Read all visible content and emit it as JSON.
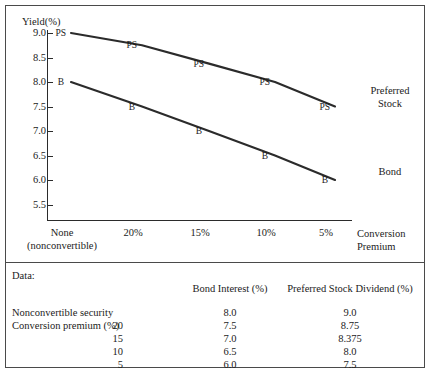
{
  "chart_data": {
    "type": "line",
    "title": "",
    "xlabel": "Conversion Premium",
    "ylabel": "Yield(%)",
    "ylim": [
      5.5,
      9.0
    ],
    "grid": false,
    "legend_position": "right-inline",
    "categories": [
      "None\n(nonconvertible)",
      "20%",
      "15%",
      "10%",
      "5%"
    ],
    "x_tick_labels": [
      "None",
      "20%",
      "15%",
      "10%",
      "5%"
    ],
    "x_tick_sublabels": [
      "(nonconvertible)",
      "",
      "",
      "",
      ""
    ],
    "y_tick_labels": [
      "9.0",
      "8.5",
      "8.0",
      "7.5",
      "7.0",
      "6.5",
      "6.0",
      "5.5"
    ],
    "y_tick_values": [
      9.0,
      8.5,
      8.0,
      7.5,
      7.0,
      6.5,
      6.0,
      5.5
    ],
    "series": [
      {
        "name": "Preferred Stock",
        "point_label": "PS",
        "values": [
          9.0,
          8.75,
          8.375,
          8.0,
          7.5
        ]
      },
      {
        "name": "Bond",
        "point_label": "B",
        "values": [
          8.0,
          7.5,
          7.0,
          6.5,
          6.0
        ]
      }
    ],
    "annotations": [
      {
        "text_line1": "Preferred",
        "text_line2": "Stock"
      },
      {
        "text_line1": "Bond",
        "text_line2": ""
      }
    ]
  },
  "chart": {
    "y_axis_title": "Yield(%)",
    "x_axis_title_line1": "Conversion",
    "x_axis_title_line2": "Premium",
    "y_ticks": [
      "9.0",
      "8.5",
      "8.0",
      "7.5",
      "7.0",
      "6.5",
      "6.0",
      "5.5"
    ],
    "x_ticks": [
      "None",
      "20%",
      "15%",
      "10%",
      "5%"
    ],
    "x_tick_sub": "(nonconvertible)",
    "ps_labels": [
      "PS",
      "PS",
      "PS",
      "PS",
      "PS"
    ],
    "b_labels": [
      "B",
      "B",
      "B",
      "B",
      "B"
    ],
    "legend_ps_line1": "Preferred",
    "legend_ps_line2": "Stock",
    "legend_bond": "Bond"
  },
  "table": {
    "caption": "Data:",
    "headers": [
      "Bond Interest (%)",
      "Preferred Stock Dividend (%)"
    ],
    "rows": [
      {
        "label": "Nonconvertible security",
        "premium": "",
        "bond": "8.0",
        "ps": "9.0"
      },
      {
        "label": "Conversion premium (%)",
        "premium": "20",
        "bond": "7.5",
        "ps": "8.75"
      },
      {
        "label": "",
        "premium": "15",
        "bond": "7.0",
        "ps": "8.375"
      },
      {
        "label": "",
        "premium": "10",
        "bond": "6.5",
        "ps": "8.0"
      },
      {
        "label": "",
        "premium": "5",
        "bond": "6.0",
        "ps": "7.5"
      }
    ]
  },
  "colors": {
    "line": "#2b2b2b",
    "border": "#4a4a4a",
    "text": "#1b1b1b",
    "background": "#ffffff"
  }
}
